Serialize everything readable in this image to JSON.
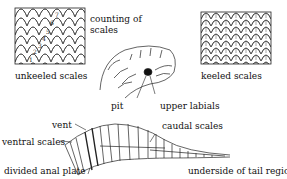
{
  "labels": {
    "counting_of_scales_line1": "counting of",
    "counting_of_scales_line2": "scales",
    "unkeeled_scales": "unkeeled scales",
    "keeled_scales": "keeled scales",
    "pit": "pit",
    "upper_labials": "upper labials",
    "caudal_scales": "caudal scales",
    "vent": "vent",
    "ventral_scales": "ventral scales",
    "divided_anal_plate": "divided anal plate",
    "underside_of_tail_region": "underside of tail region"
  },
  "scale_count_numbers": [
    "1",
    "2",
    "3",
    "4",
    "5",
    "6",
    "7"
  ]
}
